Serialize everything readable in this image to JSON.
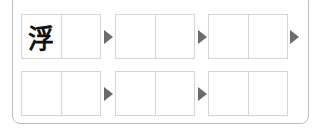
{
  "puzzle": {
    "rows": [
      {
        "pairs": [
          {
            "cells": [
              "浮",
              ""
            ]
          },
          {
            "cells": [
              "",
              ""
            ]
          },
          {
            "cells": [
              "",
              ""
            ]
          }
        ],
        "arrows": 3
      },
      {
        "pairs": [
          {
            "cells": [
              "",
              ""
            ]
          },
          {
            "cells": [
              "",
              ""
            ]
          },
          {
            "cells": [
              "",
              ""
            ]
          }
        ],
        "arrows": 2
      }
    ],
    "arrow_color": "#6b6b6b",
    "cell_border_color": "#d6d6d6"
  }
}
